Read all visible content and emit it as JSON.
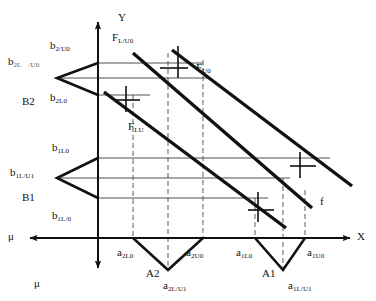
{
  "figure": {
    "type": "technical-line-diagram",
    "background": "#ffffff",
    "ink": "#111111",
    "grid_color": "#555555"
  },
  "axes": [
    {
      "name": "y-axis",
      "label": "Y",
      "direction": "up",
      "label_x": 118,
      "label_y": 12
    },
    {
      "name": "x-axis",
      "label": "X",
      "direction": "right",
      "label_x": 357,
      "label_y": 231
    },
    {
      "name": "mu-axis-left",
      "label": "μ",
      "direction": "left",
      "label_x": 8,
      "label_y": 231
    },
    {
      "name": "mu-axis-down",
      "label": "μ",
      "direction": "down",
      "label_x": 34,
      "label_y": 278
    }
  ],
  "origin": {
    "x": 98,
    "y": 238
  },
  "zones": {
    "B2": {
      "group_label": "B2",
      "group_label_x": 22,
      "group_label_y": 96,
      "apex_x": 57,
      "apex_y": 78,
      "top_y": 63,
      "mid_y": 78,
      "bottom_y": 95,
      "labels": [
        {
          "name": "b2-upper",
          "base": "b",
          "sub": "2/U0",
          "x": 50,
          "y": 36
        },
        {
          "name": "b2-middle",
          "base": "b",
          "sub": "2L",
          "sub2": "/U0",
          "x": 8,
          "y": 52
        },
        {
          "name": "b2-lower",
          "base": "b",
          "sub": "2L0",
          "x": 50,
          "y": 88
        }
      ]
    },
    "B1": {
      "group_label": "B1",
      "group_label_x": 22,
      "group_label_y": 192,
      "apex_x": 57,
      "apex_y": 178,
      "top_y": 158,
      "mid_y": 178,
      "bottom_y": 198,
      "labels": [
        {
          "name": "b1-upper",
          "base": "b",
          "sub": "1L0",
          "x": 52,
          "y": 138
        },
        {
          "name": "b1-middle",
          "base": "b",
          "sub": "1L/U1",
          "x": 10,
          "y": 163
        },
        {
          "name": "b1-lower",
          "base": "b",
          "sub": "1L/0",
          "x": 52,
          "y": 206
        }
      ]
    },
    "A2": {
      "group_label": "A2",
      "group_label_x": 146,
      "group_label_y": 268,
      "apex_x": 168,
      "apex_y": 270,
      "left_x": 133,
      "mid_x": 168,
      "right_x": 203,
      "labels": [
        {
          "name": "a2-left",
          "base": "a",
          "sub": "2L0",
          "x": 117,
          "y": 243
        },
        {
          "name": "a2-right",
          "base": "a",
          "sub": "2U0",
          "x": 186,
          "y": 243
        },
        {
          "name": "a2-apex",
          "base": "a",
          "sub": "2L/U1",
          "x": 163,
          "y": 276
        }
      ]
    },
    "A1": {
      "group_label": "A1",
      "group_label_x": 262,
      "group_label_y": 268,
      "apex_x": 283,
      "apex_y": 270,
      "left_x": 255,
      "mid_x": 283,
      "right_x": 305,
      "labels": [
        {
          "name": "a1-left",
          "base": "a",
          "sub": "1L0",
          "x": 236,
          "y": 243
        },
        {
          "name": "a1-right",
          "base": "a",
          "sub": "1U0",
          "x": 307,
          "y": 243
        },
        {
          "name": "a1-apex",
          "base": "a",
          "sub": "1L/U1",
          "x": 288,
          "y": 276
        }
      ]
    }
  },
  "diagonals": [
    {
      "name": "f-line-upper",
      "label": {
        "base": "F",
        "sub": "L/U0",
        "x": 112,
        "y": 28
      },
      "x1": 133,
      "y1": 53,
      "x2": 312,
      "y2": 208
    },
    {
      "name": "f-line-middle",
      "label": {
        "base": "F",
        "sub": "U0",
        "x": 196,
        "y": 58
      },
      "x1": 172,
      "y1": 50,
      "x2": 352,
      "y2": 186
    },
    {
      "name": "f-line-lower",
      "label": {
        "base": "F",
        "sub": "LU",
        "x": 128,
        "y": 117
      },
      "x1": 104,
      "y1": 92,
      "x2": 286,
      "y2": 228
    }
  ],
  "extra_labels": [
    {
      "name": "f-small-label",
      "text": "f",
      "x": 320,
      "y": 196
    }
  ],
  "grid": {
    "vertical_dashed_x": [
      133,
      168,
      203,
      255,
      283,
      305
    ],
    "horizontal_solid_y": [
      63,
      78,
      95,
      158,
      178,
      198
    ]
  }
}
